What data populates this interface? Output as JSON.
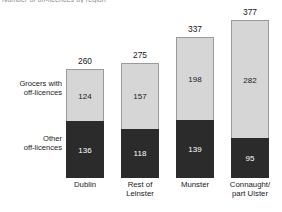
{
  "clipped_title": "Number of off-licences by region",
  "chart_data": {
    "type": "bar",
    "subtype": "stacked-bar",
    "title": "Number of off-licences by region",
    "xlabel": "",
    "ylabel": "",
    "grid": false,
    "axes_visible": false,
    "tick_labels_visible": false,
    "legend_position": "left",
    "ylim": [
      0,
      377
    ],
    "categories": [
      "Dublin",
      "Rest of\nLeinster",
      "Munster",
      "Connaught/\npart Ulster"
    ],
    "category_lines": [
      [
        "Dublin"
      ],
      [
        "Rest of",
        "Leinster"
      ],
      [
        "Munster"
      ],
      [
        "Connaught/",
        "part Ulster"
      ]
    ],
    "series": [
      {
        "name": "Other off-licences",
        "name_lines": [
          "Other",
          "off-licences"
        ],
        "color": "#2b2b2b",
        "stack_position": "bottom",
        "values": [
          136,
          118,
          139,
          95
        ]
      },
      {
        "name": "Grocers with off-licences",
        "name_lines": [
          "Grocers with",
          "off-licences"
        ],
        "color": "#d6d6d6",
        "stack_position": "top",
        "values": [
          124,
          157,
          198,
          282
        ]
      }
    ],
    "totals": [
      260,
      275,
      337,
      377
    ],
    "bars": [
      {
        "category": "Dublin",
        "other": 136,
        "grocers": 124,
        "total": 260
      },
      {
        "category": "Rest of Leinster",
        "other": 118,
        "grocers": 157,
        "total": 275
      },
      {
        "category": "Munster",
        "other": 139,
        "grocers": 198,
        "total": 337
      },
      {
        "category": "Connaught/part Ulster",
        "other": 95,
        "grocers": 282,
        "total": 377
      }
    ]
  }
}
